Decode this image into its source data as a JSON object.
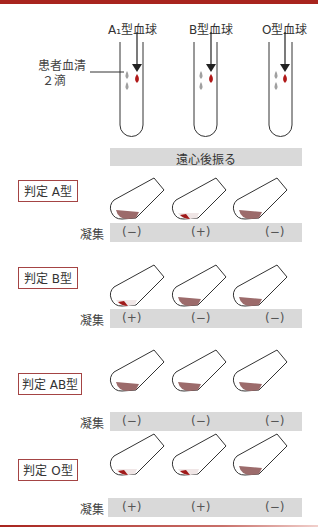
{
  "header": {
    "color": "#a8241e"
  },
  "top_section": {
    "columns": [
      {
        "label": "A₁型血球"
      },
      {
        "label": "B型血球"
      },
      {
        "label": "O型血球"
      }
    ],
    "serum_label_line1": "患者血清",
    "serum_label_line2": "２滴",
    "centrifuge_label": "遠心後振る"
  },
  "aggregation_label": "凝集",
  "judgments": [
    {
      "label": "判定  A型",
      "results": [
        "(−)",
        "(+)",
        "(−)"
      ]
    },
    {
      "label": "判定  B型",
      "results": [
        "(+)",
        "(−)",
        "(−)"
      ]
    },
    {
      "label": "判定  AB型",
      "results": [
        "(−)",
        "(−)",
        "(−)"
      ]
    },
    {
      "label": "判定  O型",
      "results": [
        "(+)",
        "(+)",
        "(−)"
      ]
    }
  ],
  "colors": {
    "blood": "#b01818",
    "serum": "#a0a0a0",
    "sediment": "#9c6b6b",
    "bar": "#d9d9d9",
    "box_border": "#a44444"
  }
}
